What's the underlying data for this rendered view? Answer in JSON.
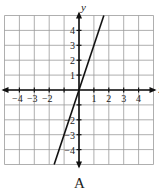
{
  "chart_data": {
    "type": "line",
    "title": "",
    "caption": "A",
    "xlabel": "x",
    "ylabel": "y",
    "xlim": [
      -5,
      5
    ],
    "ylim": [
      -5,
      5
    ],
    "grid": true,
    "x_tick_labels": [
      "-4",
      "-3",
      "-2",
      "1",
      "2",
      "3",
      "4"
    ],
    "x_tick_values": [
      -4,
      -3,
      -2,
      1,
      2,
      3,
      4
    ],
    "y_tick_labels": [
      "4",
      "3",
      "2",
      "1",
      "-2",
      "-3",
      "-4"
    ],
    "y_tick_values": [
      4,
      3,
      2,
      1,
      -2,
      -3,
      -4
    ],
    "series": [
      {
        "name": "y = 3x",
        "equation": "y = 3x",
        "slope": 3,
        "intercept": 0,
        "x": [
          -1.667,
          1.667
        ],
        "y": [
          -5,
          5
        ]
      }
    ],
    "colors": {
      "grid": "#9a9a9a",
      "axes": "#111111",
      "line": "#111111"
    }
  }
}
